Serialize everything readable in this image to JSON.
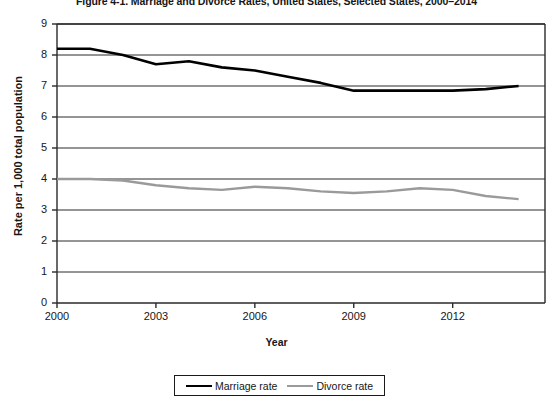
{
  "figure": {
    "title": "Figure 4-1. Marriage and Divorce Rates, United States, Selected States, 2000–2014",
    "x_axis_title": "Year",
    "y_axis_title": "Rate per 1,000 total population"
  },
  "legend": {
    "position": "bottom-center",
    "entries": [
      {
        "label": "Marriage rate",
        "color": "#000000"
      },
      {
        "label": "Divorce rate",
        "color": "#9a9a9a"
      }
    ]
  },
  "chart_data": {
    "type": "line",
    "title": "Figure 4-1. Marriage and Divorce Rates, United States, Selected States, 2000–2014",
    "xlabel": "Year",
    "ylabel": "Rate per 1,000 total population",
    "xlim": [
      2000,
      2014.8
    ],
    "ylim": [
      0,
      9
    ],
    "grid": true,
    "grid_axis": "y",
    "x": [
      2000,
      2001,
      2002,
      2003,
      2004,
      2005,
      2006,
      2007,
      2008,
      2009,
      2010,
      2011,
      2012,
      2013,
      2014
    ],
    "xticks": [
      2000,
      2003,
      2006,
      2009,
      2012
    ],
    "xtick_labels": [
      "2000",
      "2003",
      "2006",
      "2009",
      "2012"
    ],
    "yticks": [
      0,
      1,
      2,
      3,
      4,
      5,
      6,
      7,
      8,
      9
    ],
    "ytick_labels": [
      "0",
      "1",
      "2",
      "3",
      "4",
      "5",
      "6",
      "7",
      "8",
      "9"
    ],
    "series": [
      {
        "name": "Marriage rate",
        "color": "#000000",
        "linewidth": 2.6,
        "values": [
          8.2,
          8.2,
          8.0,
          7.7,
          7.8,
          7.6,
          7.5,
          7.3,
          7.1,
          6.85,
          6.85,
          6.85,
          6.85,
          6.9,
          7.0
        ]
      },
      {
        "name": "Divorce rate",
        "color": "#9a9a9a",
        "linewidth": 2.4,
        "values": [
          4.0,
          4.0,
          3.95,
          3.8,
          3.7,
          3.65,
          3.75,
          3.7,
          3.6,
          3.55,
          3.6,
          3.7,
          3.65,
          3.45,
          3.35
        ]
      }
    ]
  }
}
